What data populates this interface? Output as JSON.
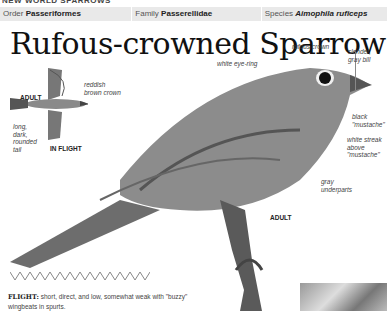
{
  "running_header": "NEW WORLD SPARROWS",
  "taxonomy": {
    "order": {
      "label": "Order",
      "value": "Passeriformes"
    },
    "family": {
      "label": "Family",
      "value": "Passerellidae"
    },
    "species": {
      "label": "Species",
      "value": "Aimophila ruficeps"
    }
  },
  "title": "Rufous-crowned Sparrow",
  "flight_illustration": {
    "caption_top": "ADULT",
    "caption_bottom": "IN FLIGHT",
    "labels": {
      "crown": "reddish brown crown",
      "tail": "long, dark, rounded tail"
    }
  },
  "main_illustration": {
    "caption": "ADULT",
    "labels": {
      "eye_ring": "white eye-ring",
      "crown": "rufous crown",
      "bill": "slender, gray bill",
      "mustache": "black \"mustache\"",
      "streak": "white streak above \"mustache\"",
      "underparts": "gray underparts"
    }
  },
  "flight": {
    "heading": "FLIGHT:",
    "text": "short, direct, and low, somewhat weak with \"buzzy\" wingbeats in spurts."
  }
}
